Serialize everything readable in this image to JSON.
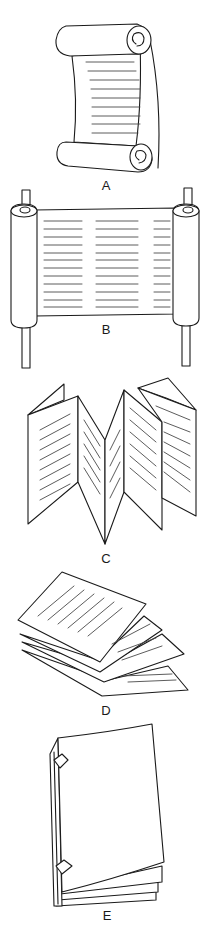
{
  "figure": {
    "panels": [
      {
        "id": "A",
        "label": "A",
        "depicts": "scroll-with-curled-ends"
      },
      {
        "id": "B",
        "label": "B",
        "depicts": "scroll-on-rollers"
      },
      {
        "id": "C",
        "label": "C",
        "depicts": "accordion-fold"
      },
      {
        "id": "D",
        "label": "D",
        "depicts": "stacked-folded-leaves"
      },
      {
        "id": "E",
        "label": "E",
        "depicts": "bound-codex"
      }
    ]
  }
}
